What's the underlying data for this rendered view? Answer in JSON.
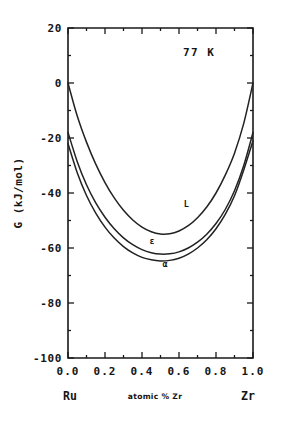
{
  "chart_data": {
    "type": "line",
    "title": "",
    "annotation": "77 K",
    "xlabel": "atomic % Zr",
    "ylabel": "G (kJ/mol)",
    "xlim": [
      0.0,
      1.0
    ],
    "ylim": [
      -100,
      20
    ],
    "grid": false,
    "legend_position": "inline-curve-labels",
    "x_ticks": [
      "0.0",
      "0.2",
      "0.4",
      "0.6",
      "0.8",
      "1.0"
    ],
    "x_tick_values": [
      0.0,
      0.2,
      0.4,
      0.6,
      0.8,
      1.0
    ],
    "y_ticks": [
      "20",
      "0",
      "-20",
      "-40",
      "-60",
      "-80",
      "-100"
    ],
    "y_tick_values": [
      20,
      0,
      -20,
      -40,
      -60,
      -80,
      -100
    ],
    "x_endpoint_labels": {
      "left": "Ru",
      "right": "Zr"
    },
    "x": [
      0.0,
      0.05,
      0.1,
      0.15,
      0.2,
      0.25,
      0.3,
      0.35,
      0.4,
      0.45,
      0.5,
      0.55,
      0.6,
      0.65,
      0.7,
      0.75,
      0.8,
      0.85,
      0.9,
      0.95,
      1.0
    ],
    "series": [
      {
        "name": "L",
        "label": "L",
        "label_x": 0.64,
        "label_y": -45.0,
        "values": [
          0.0,
          -12.0,
          -21.5,
          -29.5,
          -36.2,
          -41.8,
          -46.3,
          -49.8,
          -52.4,
          -54.1,
          -54.9,
          -54.8,
          -53.8,
          -51.9,
          -49.0,
          -45.1,
          -40.0,
          -33.5,
          -25.5,
          -14.7,
          0.0
        ]
      },
      {
        "name": "epsilon",
        "label": "ε",
        "label_x": 0.455,
        "label_y": -58.5,
        "values": [
          -18.0,
          -28.6,
          -37.0,
          -43.6,
          -48.8,
          -53.0,
          -56.3,
          -58.8,
          -60.6,
          -61.7,
          -62.2,
          -62.1,
          -61.4,
          -60.0,
          -57.9,
          -55.0,
          -51.1,
          -46.0,
          -39.2,
          -30.0,
          -18.0
        ]
      },
      {
        "name": "alpha",
        "label": "α",
        "label_x": 0.525,
        "label_y": -67.0,
        "values": [
          -22.0,
          -32.6,
          -40.9,
          -47.3,
          -52.4,
          -56.4,
          -59.5,
          -61.8,
          -63.4,
          -64.3,
          -64.7,
          -64.5,
          -63.7,
          -62.2,
          -60.0,
          -57.0,
          -53.0,
          -47.8,
          -41.0,
          -31.6,
          -21.0
        ]
      }
    ]
  }
}
